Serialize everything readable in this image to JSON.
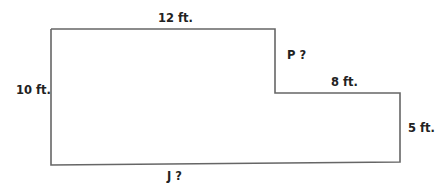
{
  "diagram": {
    "type": "L-shaped floor plan outline",
    "stroke_color": "#666666",
    "text_color": "#222222",
    "labels": {
      "top": "12 ft.",
      "left": "10 ft.",
      "inner_vertical": "P ?",
      "inner_horizontal": "8 ft.",
      "right": "5 ft.",
      "bottom": "J ?"
    }
  }
}
